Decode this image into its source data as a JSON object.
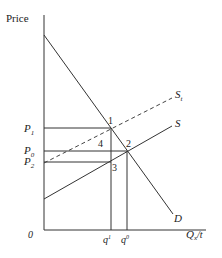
{
  "diagram": {
    "type": "supply-demand-tax",
    "axes": {
      "y_label": "Price",
      "x_label_main": "Q",
      "x_label_sub": "x",
      "x_label_suffix": "/t",
      "origin_label": "0"
    },
    "curves": {
      "demand": {
        "label": "D"
      },
      "supply": {
        "label": "S"
      },
      "supply_tax": {
        "label_main": "S",
        "label_sub": "t"
      }
    },
    "price_levels": [
      {
        "main": "P",
        "sub": "1"
      },
      {
        "main": "P",
        "sub": "0"
      },
      {
        "main": "P",
        "sub": "2"
      }
    ],
    "quantity_levels": [
      {
        "main": "q",
        "sup": "1"
      },
      {
        "main": "q",
        "sup": "0"
      }
    ],
    "points": [
      "1",
      "2",
      "3",
      "4"
    ],
    "colors": {
      "line": "#333333",
      "text": "#222222",
      "background": "#ffffff"
    }
  }
}
